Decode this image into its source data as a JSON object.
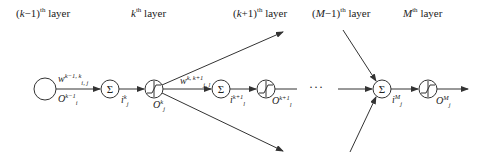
{
  "diagram": {
    "type": "neural-network-layer-flow",
    "layers": [
      {
        "id": "k-minus-1",
        "prefix": "(",
        "var": "k",
        "suffix": "−1)",
        "sup": "th",
        "word": "layer"
      },
      {
        "id": "k",
        "prefix": "",
        "var": "k",
        "suffix": "",
        "sup": "th",
        "word": "layer"
      },
      {
        "id": "k-plus-1",
        "prefix": "(",
        "var": "k",
        "suffix": "+1)",
        "sup": "th",
        "word": "layer"
      },
      {
        "id": "M-minus-1",
        "prefix": "(",
        "var": "M",
        "suffix": "−1)",
        "sup": "th",
        "word": "layer"
      },
      {
        "id": "M",
        "prefix": "",
        "var": "M",
        "suffix": "",
        "sup": "th",
        "word": "layer"
      }
    ],
    "labels": {
      "w1": {
        "base": "w",
        "sup": "k−1, k",
        "sub": "i, j"
      },
      "o1": {
        "base": "O",
        "sup": "k−1",
        "sub": "i"
      },
      "i1": {
        "base": "i",
        "sup": "k",
        "sub": "j"
      },
      "o2": {
        "base": "O",
        "sup": "k",
        "sub": "j"
      },
      "w2": {
        "base": "w",
        "sup": "k, k+1",
        "sub": "j, l"
      },
      "i2": {
        "base": "i",
        "sup": "k+1",
        "sub": "l"
      },
      "o3": {
        "base": "O",
        "sup": "k+1",
        "sub": "l"
      },
      "i3": {
        "base": "i",
        "sup": "M",
        "sub": "j"
      },
      "o4": {
        "base": "O",
        "sup": "M",
        "sub": "j"
      }
    },
    "symbols": {
      "sum": "Σ",
      "ellipsis": "···"
    },
    "colors": {
      "stroke": "#333333",
      "text": "#222222",
      "background": "#ffffff"
    }
  }
}
